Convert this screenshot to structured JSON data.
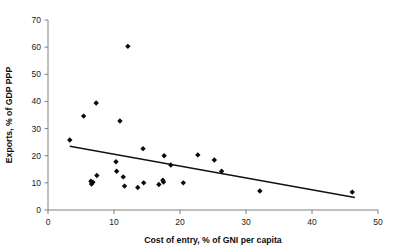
{
  "chart_data": {
    "type": "scatter",
    "title": "",
    "xlabel": "Cost of entry, % of GNI per capita",
    "ylabel": "Exports, % of GDP PPP",
    "xlim": [
      0,
      50
    ],
    "ylim": [
      0,
      70
    ],
    "xticks": [
      0,
      10,
      20,
      30,
      40,
      50
    ],
    "yticks": [
      0,
      10,
      20,
      30,
      40,
      50,
      60,
      70
    ],
    "grid": false,
    "legend": null,
    "marker": "diamond",
    "marker_color": "#0a0a0a",
    "trendline_color": "#111111",
    "points": [
      {
        "x": 3.3,
        "y": 25.8
      },
      {
        "x": 5.4,
        "y": 34.6
      },
      {
        "x": 6.5,
        "y": 10.6
      },
      {
        "x": 6.6,
        "y": 9.6
      },
      {
        "x": 6.8,
        "y": 10.2
      },
      {
        "x": 7.3,
        "y": 39.4
      },
      {
        "x": 7.4,
        "y": 12.7
      },
      {
        "x": 10.3,
        "y": 17.8
      },
      {
        "x": 10.4,
        "y": 14.3
      },
      {
        "x": 10.9,
        "y": 32.8
      },
      {
        "x": 11.4,
        "y": 12.2
      },
      {
        "x": 11.6,
        "y": 8.8
      },
      {
        "x": 12.1,
        "y": 60.3
      },
      {
        "x": 13.6,
        "y": 8.3
      },
      {
        "x": 14.4,
        "y": 22.6
      },
      {
        "x": 14.5,
        "y": 10.0
      },
      {
        "x": 16.8,
        "y": 9.4
      },
      {
        "x": 17.4,
        "y": 11.0
      },
      {
        "x": 17.5,
        "y": 10.3
      },
      {
        "x": 17.6,
        "y": 20.0
      },
      {
        "x": 18.6,
        "y": 16.6
      },
      {
        "x": 20.5,
        "y": 10.0
      },
      {
        "x": 22.7,
        "y": 20.3
      },
      {
        "x": 25.2,
        "y": 18.4
      },
      {
        "x": 26.3,
        "y": 14.3
      },
      {
        "x": 32.1,
        "y": 7.0
      },
      {
        "x": 46.1,
        "y": 6.6
      }
    ],
    "trendline": {
      "x0": 3.3,
      "y0": 23.5,
      "x1": 46.5,
      "y1": 4.6
    }
  },
  "axes": {
    "x_tick_labels": [
      "0",
      "10",
      "20",
      "30",
      "40",
      "50"
    ],
    "y_tick_labels": [
      "0",
      "10",
      "20",
      "30",
      "40",
      "50",
      "60",
      "70"
    ]
  },
  "header": {
    "cropped_title": ""
  }
}
